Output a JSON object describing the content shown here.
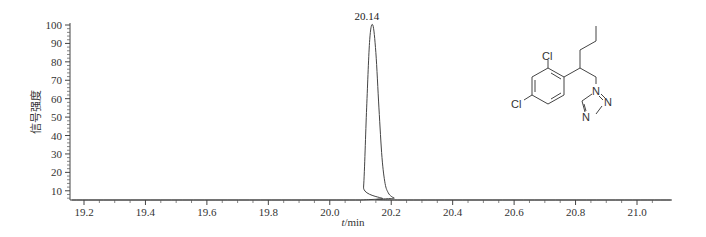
{
  "chart_data": {
    "type": "line",
    "title": "",
    "xlabel": "t/min",
    "ylabel": "信号强度",
    "xlim": [
      19.16,
      21.11
    ],
    "ylim": [
      5,
      100
    ],
    "x_ticks": [
      19.2,
      19.4,
      19.6,
      19.8,
      20.0,
      20.2,
      20.4,
      20.6,
      20.8,
      21.0
    ],
    "x_tick_labels": [
      "19.2",
      "19.4",
      "19.6",
      "19.8",
      "20.0",
      "20.2",
      "20.4",
      "20.6",
      "20.8",
      "21.0"
    ],
    "y_ticks": [
      10,
      20,
      30,
      40,
      50,
      60,
      70,
      80,
      90,
      100
    ],
    "y_tick_labels": [
      "10",
      "20",
      "30",
      "40",
      "50",
      "60",
      "70",
      "80",
      "90",
      "100"
    ],
    "grid": false,
    "legend": null,
    "series": [
      {
        "name": "chromatogram",
        "x": [
          19.16,
          20.1,
          20.11,
          20.12,
          20.13,
          20.14,
          20.15,
          20.16,
          20.17,
          20.18,
          20.19,
          20.2,
          20.21,
          20.22,
          21.11
        ],
        "y": [
          5,
          5,
          12,
          55,
          92,
          100,
          85,
          55,
          28,
          14,
          9,
          7,
          6,
          5,
          5
        ]
      }
    ],
    "annotations": [
      {
        "text": "20.14",
        "x": 20.14,
        "y": 100
      }
    ],
    "inset": {
      "type": "chemical-structure",
      "atom_labels": [
        "Cl",
        "Cl",
        "N",
        "N",
        "N"
      ]
    }
  },
  "labels": {
    "peak": "20.14",
    "xlabel_italic": "t",
    "xlabel_rest": "/min",
    "ylabel": "信号强度",
    "atom_cl_top": "Cl",
    "atom_cl_left": "Cl",
    "atom_n1": "N",
    "atom_n2": "N",
    "atom_n3": "N"
  }
}
